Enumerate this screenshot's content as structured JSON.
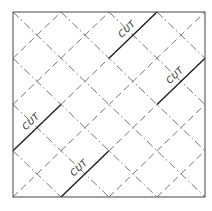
{
  "diagram": {
    "title": "",
    "square": {
      "x0": 13,
      "y0": 12,
      "x1": 205,
      "y1": 197,
      "divisions": 4
    },
    "fold_lines": {
      "up_right_style": "dashed",
      "down_right_style": "dash-dot"
    },
    "cuts": [
      {
        "label": "CUT",
        "from": [
          3,
          0
        ],
        "to": [
          2,
          1
        ]
      },
      {
        "label": "CUT",
        "from": [
          4,
          1
        ],
        "to": [
          3,
          2
        ]
      },
      {
        "label": "CUT",
        "from": [
          0,
          3
        ],
        "to": [
          1,
          2
        ]
      },
      {
        "label": "CUT",
        "from": [
          1,
          4
        ],
        "to": [
          2,
          3
        ]
      }
    ],
    "colors": {
      "border": "#555555",
      "fold": "#666666",
      "cut": "#222222",
      "label": "#333333"
    }
  }
}
